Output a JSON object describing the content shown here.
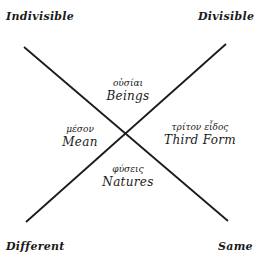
{
  "diagram": {
    "corners": {
      "top_left": "Indivisible",
      "top_right": "Divisible",
      "bottom_left": "Different",
      "bottom_right": "Same"
    },
    "regions": {
      "top": {
        "greek": "οὐσίαι",
        "english": "Beings"
      },
      "left": {
        "greek": "μέσον",
        "english": "Mean"
      },
      "right": {
        "greek": "τρίτον εἶδος",
        "english": "Third Form"
      },
      "bottom": {
        "greek": "φύσεις",
        "english": "Natures"
      }
    },
    "lines": [
      {
        "from": "Indivisible",
        "to": "Same"
      },
      {
        "from": "Divisible",
        "to": "Different"
      }
    ],
    "line_color": "#1a1a1a"
  }
}
